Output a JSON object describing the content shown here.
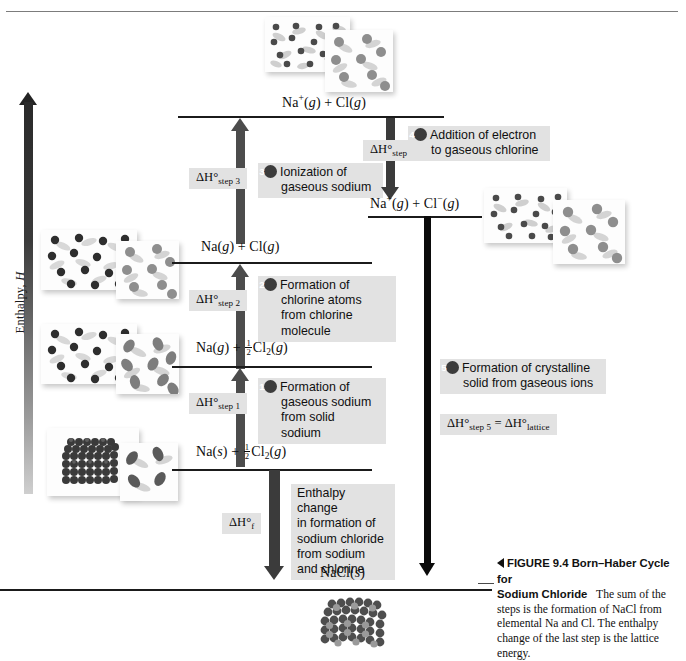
{
  "figure": {
    "axis_label_prefix": "Enthalpy, ",
    "axis_label_symbol": "H",
    "caption_marker": "◀",
    "caption_figure_number": "FIGURE 9.4",
    "caption_title_line1": "Born–Haber Cycle for",
    "caption_title_line2": "Sodium Chloride",
    "caption_body": "The sum of the steps is the formation of NaCl from elemental Na and Cl. The enthalpy change of the last step is the lattice energy."
  },
  "levels": [
    {
      "id": "level-na-plus-cl",
      "label_parts": {
        "a": "Na",
        "sup": "+",
        "b": "(",
        "italic1": "g",
        "c": ") + Cl(",
        "italic2": "g",
        "d": ")"
      },
      "label_plain": "Na+(g) + Cl(g)"
    },
    {
      "id": "level-na-plus-cl-minus",
      "label_plain": "Na+(g) + Cl−(g)"
    },
    {
      "id": "level-na-g-cl-g",
      "label_plain": "Na(g) + Cl(g)"
    },
    {
      "id": "level-na-g-half-cl2",
      "label_plain": "Na(g) + ½Cl2(g)"
    },
    {
      "id": "level-na-s-half-cl2",
      "label_plain": "Na(s) + ½Cl2(g)"
    },
    {
      "id": "level-nacl-s",
      "label_plain": "NaCl(s)"
    }
  ],
  "steps": [
    {
      "number": "1",
      "dh_symbol": "ΔH°",
      "dh_subscript": "step 1",
      "text_line1": "Formation of",
      "text_line2": "gaseous sodium",
      "text_line3": "from solid sodium",
      "direction": "up"
    },
    {
      "number": "2",
      "dh_symbol": "ΔH°",
      "dh_subscript": "step 2",
      "text_line1": "Formation of",
      "text_line2": "chlorine atoms from",
      "text_line3": "chlorine molecule",
      "direction": "up"
    },
    {
      "number": "3",
      "dh_symbol": "ΔH°",
      "dh_subscript": "step 3",
      "text_line1": "Ionization of",
      "text_line2": "gaseous sodium",
      "text_line3": "",
      "direction": "up"
    },
    {
      "number": "4",
      "dh_symbol": "ΔH°",
      "dh_subscript": "step 4",
      "text_line1": "Addition of",
      "text_line2": "electron to gaseous",
      "text_line3": "chlorine",
      "direction": "down"
    },
    {
      "number": "5",
      "dh_symbol": "ΔH°",
      "dh_subscript": "step 5",
      "dh_equals": "=",
      "dh_symbol2": "ΔH°",
      "dh_subscript2": "lattice",
      "text_line1": "Formation of crystalline",
      "text_line2": "solid from gaseous ions",
      "text_line3": "",
      "direction": "down"
    }
  ],
  "formation": {
    "dh_symbol": "ΔH°",
    "dh_subscript": "f",
    "text_line1": "Enthalpy change",
    "text_line2": "in formation of",
    "text_line3": "sodium chloride",
    "text_line4": "from sodium",
    "text_line5": "and chlorine",
    "direction": "down"
  },
  "colors": {
    "gray_arrow": "#4c4c4c",
    "dark_arrow": "#3b3b3b",
    "black_arrow": "#0b0b0b",
    "note_bg": "#e2e2e2",
    "badge_bg": "#3c3c3c",
    "level_line": "#1b1b1b"
  }
}
